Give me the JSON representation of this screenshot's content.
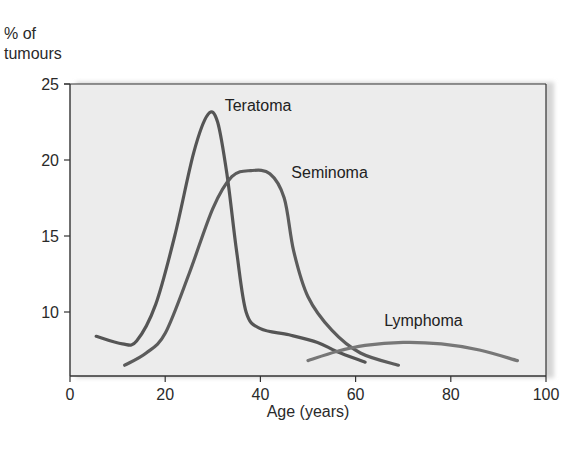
{
  "chart_data": {
    "type": "line",
    "title": "",
    "xlabel": "Age (years)",
    "ylabel": "% of\ntumours",
    "ylabel_lines": [
      "% of",
      "tumours"
    ],
    "xlim": [
      0,
      100
    ],
    "ylim": [
      6,
      25
    ],
    "x_ticks": [
      0,
      20,
      40,
      60,
      80,
      100
    ],
    "y_ticks": [
      10,
      15,
      20,
      25
    ],
    "grid": false,
    "legend": "inline labels",
    "series": [
      {
        "name": "Teratoma",
        "label_pos": {
          "x": 32.5,
          "y": 23.2
        },
        "color": "#555555",
        "points": [
          [
            5.5,
            8.4
          ],
          [
            11,
            7.9
          ],
          [
            14,
            8.1
          ],
          [
            18,
            10.5
          ],
          [
            22,
            15
          ],
          [
            26,
            20.5
          ],
          [
            29,
            23.0
          ],
          [
            31,
            22.5
          ],
          [
            33,
            19
          ],
          [
            35,
            14
          ],
          [
            37,
            10
          ],
          [
            40,
            8.9
          ],
          [
            46,
            8.5
          ],
          [
            52,
            8.0
          ],
          [
            56,
            7.4
          ],
          [
            62,
            6.7
          ]
        ]
      },
      {
        "name": "Seminoma",
        "label_pos": {
          "x": 46.5,
          "y": 18.8
        },
        "color": "#5c5c5c",
        "points": [
          [
            11.5,
            6.5
          ],
          [
            16,
            7.3
          ],
          [
            20,
            8.6
          ],
          [
            25,
            12.5
          ],
          [
            30,
            16.8
          ],
          [
            34,
            18.9
          ],
          [
            38,
            19.3
          ],
          [
            42,
            19.1
          ],
          [
            45,
            17.5
          ],
          [
            47,
            14
          ],
          [
            50,
            11
          ],
          [
            55,
            8.8
          ],
          [
            61,
            7.3
          ],
          [
            69,
            6.5
          ]
        ]
      },
      {
        "name": "Lymphoma",
        "label_pos": {
          "x": 66,
          "y": 9.1
        },
        "color": "#777777",
        "points": [
          [
            50,
            6.8
          ],
          [
            56,
            7.4
          ],
          [
            62,
            7.8
          ],
          [
            70,
            8.0
          ],
          [
            78,
            7.9
          ],
          [
            86,
            7.5
          ],
          [
            94,
            6.8
          ]
        ]
      }
    ]
  },
  "colors": {
    "plot_background": "#ececec",
    "axis": "#333333"
  }
}
